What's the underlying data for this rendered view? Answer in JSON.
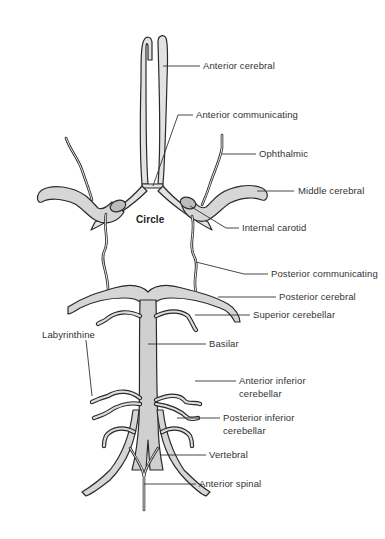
{
  "diagram": {
    "center_label": "Circle",
    "labels": {
      "anterior_cerebral": "Anterior cerebral",
      "anterior_communicating": "Anterior communicating",
      "ophthalmic": "Ophthalmic",
      "middle_cerebral": "Middle cerebral",
      "internal_carotid": "Internal carotid",
      "posterior_communicating": "Posterior communicating",
      "posterior_cerebral": "Posterior cerebral",
      "superior_cerebellar": "Superior cerebellar",
      "labyrinthine": "Labyrinthine",
      "basilar": "Basilar",
      "anterior_inferior_cerebellar_1": "Anterior inferior",
      "anterior_inferior_cerebellar_2": "cerebellar",
      "posterior_inferior_cerebellar_1": "Posterior inferior",
      "posterior_inferior_cerebellar_2": "cerebellar",
      "vertebral": "Vertebral",
      "anterior_spinal": "Anterior spinal"
    },
    "colors": {
      "vessel_fill": "#d4d4d4",
      "vessel_fill_light": "#e4e4e4",
      "outline": "#2a2a2a",
      "leader": "#333333",
      "text": "#333333"
    }
  }
}
